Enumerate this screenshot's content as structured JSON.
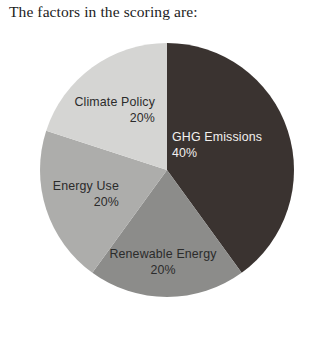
{
  "page": {
    "background_color": "#ffffff",
    "heading": "The factors in the scoring are:"
  },
  "chart_data": {
    "type": "pie",
    "title": "",
    "subtitle": "",
    "xlabel": "",
    "ylabel": "",
    "legend_position": "none",
    "grid": false,
    "labels_inside_slices": true,
    "start_angle_deg": 0,
    "direction": "clockwise",
    "total": 100,
    "units": "%",
    "categories": [
      "GHG Emissions",
      "Renewable Energy",
      "Energy Use",
      "Climate Policy"
    ],
    "values": [
      40,
      20,
      20,
      20
    ],
    "value_labels": [
      "40%",
      "20%",
      "20%",
      "20%"
    ],
    "colors": [
      "#3a3330",
      "#8c8c8a",
      "#adadab",
      "#d5d5d3"
    ],
    "slices": [
      {
        "name": "GHG Emissions",
        "value": 40,
        "value_label": "40%",
        "color": "#3a3330",
        "label_color": "#f2f0ee",
        "label_align": "left"
      },
      {
        "name": "Renewable Energy",
        "value": 20,
        "value_label": "20%",
        "color": "#8c8c8a",
        "label_color": "#2b2b2b",
        "label_align": "middle"
      },
      {
        "name": "Energy Use",
        "value": 20,
        "value_label": "20%",
        "color": "#adadab",
        "label_color": "#2b2b2b",
        "label_align": "right"
      },
      {
        "name": "Climate Policy",
        "value": 20,
        "value_label": "20%",
        "color": "#d5d5d3",
        "label_color": "#2b2b2b",
        "label_align": "right"
      }
    ],
    "geometry": {
      "center_x": 167,
      "center_y": 170,
      "radius": 127
    }
  }
}
